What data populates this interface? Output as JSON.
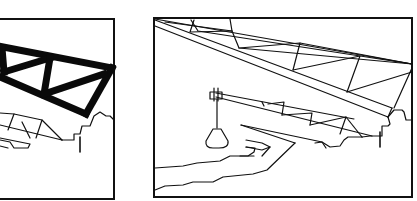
{
  "figure": {
    "panels": [
      {
        "id": "left",
        "subject": "heavy black truss segment extending from pier, partial view",
        "elements": [
          "frame",
          "heavy-truss-segment",
          "light-truss-below",
          "stepped-pier",
          "vertical-mark"
        ]
      },
      {
        "id": "right",
        "subject": "cantilever arm with crane jib lowering a load over the riverbank",
        "elements": [
          "frame",
          "upper-truss",
          "diagonal-chord",
          "crane-jib",
          "hanging-load",
          "stepped-pier",
          "vertical-mark",
          "riverbank-lines"
        ]
      }
    ],
    "colors": {
      "line": "#111111",
      "background": "#ffffff"
    }
  }
}
